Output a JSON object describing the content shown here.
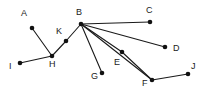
{
  "figure": {
    "type": "graph-diagram",
    "width": 203,
    "height": 93,
    "background_color": "#ffffff",
    "node_color": "#111111",
    "edge_color": "#1a1a1a",
    "label_color": "#1a1a1a"
  },
  "nodes": [
    {
      "id": "A",
      "label": "A",
      "x": 32,
      "y": 28,
      "label_x": 21,
      "label_y": 9,
      "label_pos": "above-left"
    },
    {
      "id": "B",
      "label": "B",
      "x": 81,
      "y": 24,
      "label_x": 76,
      "label_y": 8,
      "label_pos": "above"
    },
    {
      "id": "C",
      "label": "C",
      "x": 150,
      "y": 22,
      "label_x": 146,
      "label_y": 6,
      "label_pos": "above"
    },
    {
      "id": "D",
      "label": "D",
      "x": 165,
      "y": 47,
      "label_x": 173,
      "label_y": 44,
      "label_pos": "right"
    },
    {
      "id": "E",
      "label": "E",
      "x": 122,
      "y": 52,
      "label_x": 114,
      "label_y": 58,
      "label_pos": "below-left"
    },
    {
      "id": "F",
      "label": "F",
      "x": 152,
      "y": 80,
      "label_x": 142,
      "label_y": 79,
      "label_pos": "below-left"
    },
    {
      "id": "G",
      "label": "G",
      "x": 102,
      "y": 73,
      "label_x": 91,
      "label_y": 72,
      "label_pos": "below-left"
    },
    {
      "id": "H",
      "label": "H",
      "x": 52,
      "y": 56,
      "label_x": 49,
      "label_y": 60,
      "label_pos": "below"
    },
    {
      "id": "I",
      "label": "I",
      "x": 20,
      "y": 63,
      "label_x": 9,
      "label_y": 62,
      "label_pos": "left"
    },
    {
      "id": "J",
      "label": "J",
      "x": 188,
      "y": 74,
      "label_x": 191,
      "label_y": 62,
      "label_pos": "above-right"
    },
    {
      "id": "K",
      "label": "K",
      "x": 66,
      "y": 41,
      "label_x": 56,
      "label_y": 27,
      "label_pos": "above-left"
    }
  ],
  "edges": [
    {
      "from": "A",
      "to": "H"
    },
    {
      "from": "I",
      "to": "H"
    },
    {
      "from": "H",
      "to": "K"
    },
    {
      "from": "K",
      "to": "B"
    },
    {
      "from": "B",
      "to": "C"
    },
    {
      "from": "B",
      "to": "D"
    },
    {
      "from": "B",
      "to": "E"
    },
    {
      "from": "B",
      "to": "F"
    },
    {
      "from": "B",
      "to": "G"
    },
    {
      "from": "E",
      "to": "F"
    },
    {
      "from": "F",
      "to": "J"
    }
  ]
}
